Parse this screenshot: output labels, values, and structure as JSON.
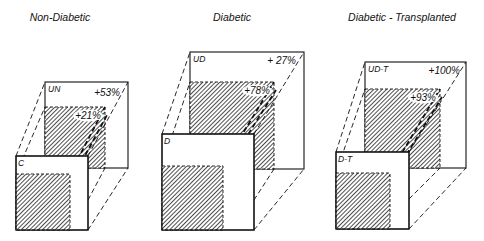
{
  "figure": {
    "panels": [
      {
        "title": "Non-Diabetic",
        "back_label": "UN",
        "front_label": "C",
        "outer_change": "+53%",
        "inner_change": "+21%",
        "geom": {
          "back": [
            45,
            82,
            128,
            168
          ],
          "back_hatch": [
            45,
            107,
            105,
            168
          ],
          "front": [
            16,
            156,
            88,
            230
          ],
          "front_hatch": [
            16,
            174,
            70,
            230
          ],
          "title_x": 60,
          "title_y": 21
        }
      },
      {
        "title": "Diabetic",
        "back_label": "UD",
        "front_label": "D",
        "outer_change": "+ 27%",
        "inner_change": "+78%",
        "geom": {
          "back": [
            190,
            52,
            304,
            169
          ],
          "back_hatch": [
            190,
            82,
            274,
            169
          ],
          "front": [
            162,
            134,
            254,
            230
          ],
          "front_hatch": [
            162,
            166,
            223,
            230
          ],
          "title_x": 232,
          "title_y": 21
        }
      },
      {
        "title": "Diabetic - Transplanted",
        "back_label": "UD-T",
        "front_label": "D-T",
        "outer_change": "+100%",
        "inner_change": "+93%",
        "geom": {
          "back": [
            365,
            62,
            466,
            168
          ],
          "back_hatch": [
            365,
            89,
            440,
            168
          ],
          "front": [
            336,
            152,
            409,
            229
          ],
          "front_hatch": [
            336,
            173,
            390,
            229
          ],
          "title_x": 402,
          "title_y": 21
        }
      }
    ],
    "colors": {
      "ink": "#111111",
      "background": "#ffffff"
    }
  }
}
